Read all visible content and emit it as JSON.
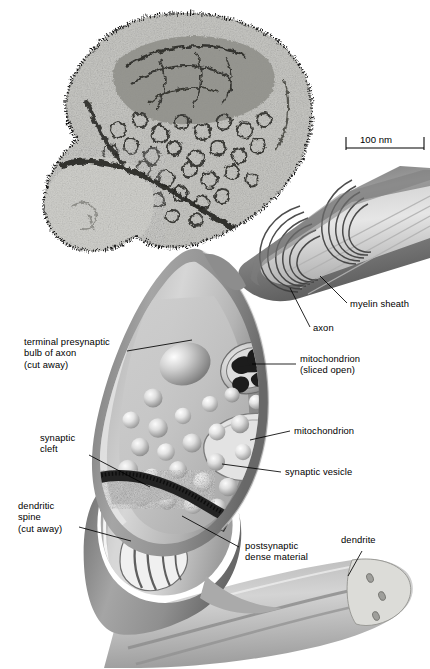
{
  "figure": {
    "kind": "synapse-figure",
    "micrograph": {
      "name": "electron-micrograph-of-synapse",
      "scale_bar": {
        "label": "100 nm",
        "length_nm": 100
      }
    }
  },
  "labels": [
    {
      "id": "terminal-bulb",
      "text": "terminal presynaptic\nbulb of axon\n(cut away)",
      "side": "left"
    },
    {
      "id": "synaptic-cleft",
      "text": "synaptic\ncleft",
      "side": "left"
    },
    {
      "id": "dendritic-spine",
      "text": "dendritic\nspine\n(cut away)",
      "side": "left"
    },
    {
      "id": "myelin-sheath",
      "text": "myelin sheath",
      "side": "right"
    },
    {
      "id": "axon",
      "text": "axon",
      "side": "right"
    },
    {
      "id": "mitochondrion-sliced",
      "text": "mitochondrion\n(sliced open)",
      "side": "right"
    },
    {
      "id": "mitochondrion",
      "text": "mitochondrion",
      "side": "right"
    },
    {
      "id": "synaptic-vesicle",
      "text": "synaptic vesicle",
      "side": "right"
    },
    {
      "id": "postsynaptic-density",
      "text": "postsynaptic\ndense material",
      "side": "right"
    },
    {
      "id": "dendrite",
      "text": "dendrite",
      "side": "right"
    }
  ],
  "colors": {
    "background": "#ffffff",
    "ink": "#000000",
    "membrane_mid": "#9a9a9a",
    "membrane_dark": "#6e6e6e",
    "cytoplasm_light": "#d8d8d8",
    "cytoplasm_mid": "#bdbdbd",
    "vesicle_light": "#e6e6e6",
    "cleft_dark": "#2b2b2b",
    "micrograph_fill": "#cfcfcb"
  }
}
